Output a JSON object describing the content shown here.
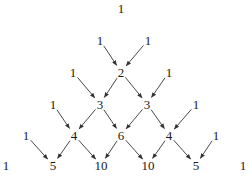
{
  "diagram": {
    "nodes": [
      {
        "id": "r0c0",
        "label": "1",
        "x": 121,
        "y": 8
      },
      {
        "id": "r1c0",
        "label": "1",
        "x": 100,
        "y": 40
      },
      {
        "id": "r1c1",
        "label": "1",
        "x": 148,
        "y": 40
      },
      {
        "id": "r2c0",
        "label": "1",
        "x": 73,
        "y": 72
      },
      {
        "id": "r2c1",
        "label": "2",
        "x": 121,
        "y": 72
      },
      {
        "id": "r2c2",
        "label": "1",
        "x": 169,
        "y": 72
      },
      {
        "id": "r3c0",
        "label": "1",
        "x": 53,
        "y": 104
      },
      {
        "id": "r3c1",
        "label": "3",
        "x": 100,
        "y": 104
      },
      {
        "id": "r3c2",
        "label": "3",
        "x": 147,
        "y": 104
      },
      {
        "id": "r3c3",
        "label": "1",
        "x": 196,
        "y": 104
      },
      {
        "id": "r4c0",
        "label": "1",
        "x": 26,
        "y": 135
      },
      {
        "id": "r4c1",
        "label": "4",
        "x": 74,
        "y": 135
      },
      {
        "id": "r4c2",
        "label": "6",
        "x": 121,
        "y": 135
      },
      {
        "id": "r4c3",
        "label": "4",
        "x": 169,
        "y": 135
      },
      {
        "id": "r4c4",
        "label": "1",
        "x": 216,
        "y": 135
      },
      {
        "id": "r5c0",
        "label": "1",
        "x": 6,
        "y": 165
      },
      {
        "id": "r5c1",
        "label": "5",
        "x": 53,
        "y": 165
      },
      {
        "id": "r5c2",
        "label": "10",
        "x": 101,
        "y": 165
      },
      {
        "id": "r5c3",
        "label": "10",
        "x": 148,
        "y": 165
      },
      {
        "id": "r5c4",
        "label": "5",
        "x": 196,
        "y": 165
      },
      {
        "id": "r5c5",
        "label": "1",
        "x": 243,
        "y": 165
      }
    ],
    "edges": [
      [
        "r1c0",
        "r2c1"
      ],
      [
        "r1c1",
        "r2c1"
      ],
      [
        "r2c0",
        "r3c1"
      ],
      [
        "r2c1",
        "r3c1"
      ],
      [
        "r2c1",
        "r3c2"
      ],
      [
        "r2c2",
        "r3c2"
      ],
      [
        "r3c0",
        "r4c1"
      ],
      [
        "r3c1",
        "r4c1"
      ],
      [
        "r3c1",
        "r4c2"
      ],
      [
        "r3c2",
        "r4c2"
      ],
      [
        "r3c2",
        "r4c3"
      ],
      [
        "r3c3",
        "r4c3"
      ],
      [
        "r4c0",
        "r5c1"
      ],
      [
        "r4c1",
        "r5c1"
      ],
      [
        "r4c1",
        "r5c2"
      ],
      [
        "r4c2",
        "r5c2"
      ],
      [
        "r4c2",
        "r5c3"
      ],
      [
        "r4c3",
        "r5c3"
      ],
      [
        "r4c3",
        "r5c4"
      ],
      [
        "r4c4",
        "r5c4"
      ]
    ],
    "rows": [
      [
        "1"
      ],
      [
        "1",
        "1"
      ],
      [
        "1",
        "2",
        "1"
      ],
      [
        "1",
        "3",
        "3",
        "1"
      ],
      [
        "1",
        "4",
        "6",
        "4",
        "1"
      ],
      [
        "1",
        "5",
        "10",
        "10",
        "5",
        "1"
      ]
    ]
  }
}
